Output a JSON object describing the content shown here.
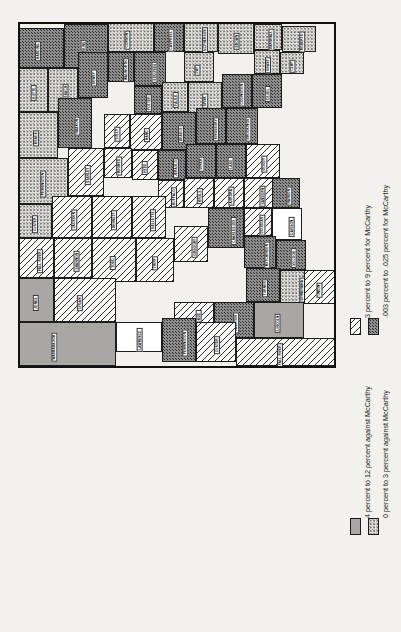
{
  "figure": {
    "kind": "thematic-choropleth-map",
    "orientation": "rotated-90-ccw",
    "region": "South Dakota counties",
    "background_color": "#f2f1ee"
  },
  "legend": {
    "entries": [
      {
        "id": "for-3-to-9",
        "swatch": "diagonal-hatch",
        "label": "3 percent to 9 percent for McCarthy",
        "color": "#fbfbf9"
      },
      {
        "id": "for-003-to-025",
        "swatch": "dark-stipple",
        "label": ".003 percent to .025 percent for McCarthy",
        "color": "#8e8e8e"
      },
      {
        "id": "against-4-to-12",
        "swatch": "solid-gray",
        "label": "4 percent to 12 percent against McCarthy",
        "color": "#a8a7a3"
      },
      {
        "id": "against-0-to-3",
        "swatch": "light-stipple",
        "label": "0 percent to 3 percent against McCarthy",
        "color": "#e3e2de"
      }
    ]
  },
  "map": {
    "counties": [
      {
        "name": "HARDING",
        "fill": "p-dark",
        "x": 0,
        "y": 6,
        "w": 46,
        "h": 40,
        "lx": 10,
        "ly": 26
      },
      {
        "name": "PERKINS",
        "fill": "p-dark",
        "x": 46,
        "y": 2,
        "w": 44,
        "h": 44,
        "lx": 56,
        "ly": 24
      },
      {
        "name": "CORSON",
        "fill": "p-light",
        "x": 90,
        "y": 0,
        "w": 46,
        "h": 30,
        "lx": 100,
        "ly": 15
      },
      {
        "name": "CAMPBELL",
        "fill": "p-dark",
        "x": 136,
        "y": 0,
        "w": 30,
        "h": 30,
        "lx": 142,
        "ly": 15
      },
      {
        "name": "MCPHERSON",
        "fill": "p-light",
        "x": 166,
        "y": 0,
        "w": 34,
        "h": 30,
        "lx": 174,
        "ly": 15
      },
      {
        "name": "BROWN",
        "fill": "p-light",
        "x": 200,
        "y": 0,
        "w": 36,
        "h": 32,
        "lx": 210,
        "ly": 16
      },
      {
        "name": "MARSHALL",
        "fill": "p-light",
        "x": 236,
        "y": 2,
        "w": 28,
        "h": 26,
        "lx": 242,
        "ly": 15
      },
      {
        "name": "ROBERTS",
        "fill": "p-light",
        "x": 264,
        "y": 4,
        "w": 34,
        "h": 26,
        "lx": 274,
        "ly": 17
      },
      {
        "name": "BUTTE",
        "fill": "p-light",
        "x": 0,
        "y": 46,
        "w": 30,
        "h": 44,
        "lx": 8,
        "ly": 68
      },
      {
        "name": "ZIEBACH",
        "fill": "p-light",
        "x": 30,
        "y": 46,
        "w": 30,
        "h": 44,
        "lx": 38,
        "ly": 68
      },
      {
        "name": "DEWEY",
        "fill": "p-dark",
        "x": 60,
        "y": 30,
        "w": 30,
        "h": 46,
        "lx": 68,
        "ly": 53
      },
      {
        "name": "WALWORTH",
        "fill": "p-dark",
        "x": 90,
        "y": 30,
        "w": 26,
        "h": 30,
        "lx": 96,
        "ly": 45
      },
      {
        "name": "EDMUNDS",
        "fill": "p-dark",
        "x": 116,
        "y": 30,
        "w": 32,
        "h": 34,
        "lx": 126,
        "ly": 47
      },
      {
        "name": "DAY",
        "fill": "p-light",
        "x": 166,
        "y": 30,
        "w": 30,
        "h": 30,
        "lx": 174,
        "ly": 45
      },
      {
        "name": "GRANT",
        "fill": "p-light",
        "x": 236,
        "y": 28,
        "w": 26,
        "h": 24,
        "lx": 242,
        "ly": 40
      },
      {
        "name": "CLAY",
        "fill": "p-light",
        "x": 262,
        "y": 30,
        "w": 24,
        "h": 22,
        "lx": 268,
        "ly": 41
      },
      {
        "name": "MEADE",
        "fill": "p-light",
        "x": 0,
        "y": 90,
        "w": 40,
        "h": 46,
        "lx": 10,
        "ly": 113
      },
      {
        "name": "HAAKON",
        "fill": "p-dark",
        "x": 40,
        "y": 76,
        "w": 34,
        "h": 50,
        "lx": 50,
        "ly": 101
      },
      {
        "name": "POTTER",
        "fill": "p-dark",
        "x": 116,
        "y": 64,
        "w": 28,
        "h": 28,
        "lx": 122,
        "ly": 78
      },
      {
        "name": "FAULK",
        "fill": "p-light",
        "x": 144,
        "y": 60,
        "w": 26,
        "h": 30,
        "lx": 150,
        "ly": 75
      },
      {
        "name": "SPINK",
        "fill": "p-light",
        "x": 170,
        "y": 60,
        "w": 34,
        "h": 32,
        "lx": 180,
        "ly": 76
      },
      {
        "name": "CODINGTON",
        "fill": "p-dark",
        "x": 204,
        "y": 52,
        "w": 30,
        "h": 34,
        "lx": 212,
        "ly": 69
      },
      {
        "name": "DEUEL",
        "fill": "p-dark",
        "x": 234,
        "y": 52,
        "w": 30,
        "h": 34,
        "lx": 242,
        "ly": 69
      },
      {
        "name": "PENNINGTON",
        "fill": "p-light",
        "x": 0,
        "y": 136,
        "w": 50,
        "h": 46,
        "lx": 12,
        "ly": 159
      },
      {
        "name": "STANLEY",
        "fill": "p-hatch",
        "x": 50,
        "y": 126,
        "w": 36,
        "h": 48,
        "lx": 60,
        "ly": 150
      },
      {
        "name": "SULLY",
        "fill": "p-hatch",
        "x": 86,
        "y": 92,
        "w": 26,
        "h": 34,
        "lx": 92,
        "ly": 109
      },
      {
        "name": "HAND",
        "fill": "p-hatch",
        "x": 112,
        "y": 92,
        "w": 32,
        "h": 36,
        "lx": 122,
        "ly": 110
      },
      {
        "name": "BEADLE",
        "fill": "p-dark",
        "x": 144,
        "y": 90,
        "w": 34,
        "h": 38,
        "lx": 154,
        "ly": 109
      },
      {
        "name": "KINGSBURY",
        "fill": "p-dark",
        "x": 178,
        "y": 86,
        "w": 30,
        "h": 36,
        "lx": 186,
        "ly": 104
      },
      {
        "name": "BROOKINGS",
        "fill": "p-dark",
        "x": 208,
        "y": 86,
        "w": 32,
        "h": 36,
        "lx": 218,
        "ly": 104
      },
      {
        "name": "CUSTER",
        "fill": "p-light",
        "x": 0,
        "y": 182,
        "w": 34,
        "h": 34,
        "lx": 8,
        "ly": 199
      },
      {
        "name": "JACKSON",
        "fill": "p-hatch",
        "x": 34,
        "y": 174,
        "w": 40,
        "h": 42,
        "lx": 46,
        "ly": 195
      },
      {
        "name": "HUGHES",
        "fill": "p-hatch",
        "x": 86,
        "y": 126,
        "w": 28,
        "h": 30,
        "lx": 92,
        "ly": 141
      },
      {
        "name": "HYDE",
        "fill": "p-hatch",
        "x": 114,
        "y": 128,
        "w": 26,
        "h": 30,
        "lx": 120,
        "ly": 143
      },
      {
        "name": "JERAULD",
        "fill": "p-dark",
        "x": 140,
        "y": 128,
        "w": 28,
        "h": 30,
        "lx": 148,
        "ly": 143
      },
      {
        "name": "MINER",
        "fill": "p-dark",
        "x": 168,
        "y": 122,
        "w": 30,
        "h": 34,
        "lx": 176,
        "ly": 139
      },
      {
        "name": "LAKE",
        "fill": "p-dark",
        "x": 198,
        "y": 122,
        "w": 30,
        "h": 34,
        "lx": 206,
        "ly": 139
      },
      {
        "name": "MOODY",
        "fill": "p-hatch",
        "x": 228,
        "y": 122,
        "w": 34,
        "h": 34,
        "lx": 238,
        "ly": 139
      },
      {
        "name": "FALL RIVER",
        "fill": "p-hatch",
        "x": 0,
        "y": 216,
        "w": 36,
        "h": 40,
        "lx": 10,
        "ly": 236
      },
      {
        "name": "SHANNON",
        "fill": "p-hatch",
        "x": 36,
        "y": 216,
        "w": 38,
        "h": 40,
        "lx": 48,
        "ly": 236
      },
      {
        "name": "BUFFALO",
        "fill": "p-hatch",
        "x": 140,
        "y": 158,
        "w": 26,
        "h": 28,
        "lx": 146,
        "ly": 172
      },
      {
        "name": "BRULE",
        "fill": "p-hatch",
        "x": 166,
        "y": 156,
        "w": 30,
        "h": 30,
        "lx": 174,
        "ly": 171
      },
      {
        "name": "AURORA",
        "fill": "p-hatch",
        "x": 196,
        "y": 156,
        "w": 30,
        "h": 30,
        "lx": 204,
        "ly": 171
      },
      {
        "name": "SANBORN",
        "fill": "p-hatch",
        "x": 226,
        "y": 156,
        "w": 30,
        "h": 30,
        "lx": 234,
        "ly": 171
      },
      {
        "name": "BENNETT",
        "fill": "p-hatch",
        "x": 74,
        "y": 174,
        "w": 40,
        "h": 42,
        "lx": 86,
        "ly": 195
      },
      {
        "name": "MELLETTE",
        "fill": "p-hatch",
        "x": 114,
        "y": 174,
        "w": 34,
        "h": 42,
        "lx": 124,
        "ly": 195
      },
      {
        "name": "TODD",
        "fill": "p-hatch",
        "x": 74,
        "y": 216,
        "w": 44,
        "h": 44,
        "lx": 88,
        "ly": 238
      },
      {
        "name": "TRIPP",
        "fill": "p-hatch",
        "x": 118,
        "y": 216,
        "w": 38,
        "h": 44,
        "lx": 130,
        "ly": 238
      },
      {
        "name": "GREGORY",
        "fill": "p-hatch",
        "x": 156,
        "y": 204,
        "w": 34,
        "h": 36,
        "lx": 166,
        "ly": 222
      },
      {
        "name": "CHARLES MIX",
        "fill": "p-dark",
        "x": 190,
        "y": 186,
        "w": 36,
        "h": 40,
        "lx": 202,
        "ly": 206
      },
      {
        "name": "DOUGLAS",
        "fill": "p-hatch",
        "x": 226,
        "y": 186,
        "w": 28,
        "h": 28,
        "lx": 234,
        "ly": 200
      },
      {
        "name": "HANSON",
        "fill": "p-dark",
        "x": 254,
        "y": 156,
        "w": 28,
        "h": 30,
        "lx": 262,
        "ly": 171
      },
      {
        "name": "DAVISON",
        "fill": "p-white",
        "x": 254,
        "y": 186,
        "w": 30,
        "h": 32,
        "lx": 264,
        "ly": 202
      },
      {
        "name": "HUTCHINSON",
        "fill": "p-dark",
        "x": 226,
        "y": 214,
        "w": 32,
        "h": 32,
        "lx": 236,
        "ly": 230
      },
      {
        "name": "MCCOOK",
        "fill": "p-dark",
        "x": 258,
        "y": 218,
        "w": 30,
        "h": 30,
        "lx": 266,
        "ly": 233
      },
      {
        "name": "MINNEHAHA",
        "fill": "p-light",
        "x": 262,
        "y": 248,
        "w": 34,
        "h": 34,
        "lx": 272,
        "ly": 265
      },
      {
        "name": "TURNER",
        "fill": "p-dark",
        "x": 228,
        "y": 246,
        "w": 34,
        "h": 34,
        "lx": 238,
        "ly": 263
      },
      {
        "name": "LINCOLN",
        "fill": "p-solid",
        "x": 236,
        "y": 280,
        "w": 50,
        "h": 36,
        "lx": 250,
        "ly": 298
      },
      {
        "name": "YANKTON",
        "fill": "p-dark",
        "x": 196,
        "y": 280,
        "w": 40,
        "h": 36,
        "lx": 208,
        "ly": 298
      },
      {
        "name": "BON HOMME",
        "fill": "p-hatch",
        "x": 156,
        "y": 280,
        "w": 40,
        "h": 36,
        "lx": 168,
        "ly": 298
      },
      {
        "name": "UNION",
        "fill": "p-hatch",
        "x": 286,
        "y": 248,
        "w": 32,
        "h": 34,
        "lx": 294,
        "ly": 265
      },
      {
        "name": "LYMAN",
        "fill": "p-hatch",
        "x": 36,
        "y": 256,
        "w": 62,
        "h": 44,
        "lx": 54,
        "ly": 278
      },
      {
        "name": "JONES",
        "fill": "p-solid",
        "x": 0,
        "y": 256,
        "w": 36,
        "h": 44,
        "lx": 10,
        "ly": 278
      },
      {
        "name": "LAWRENCE",
        "fill": "p-white",
        "x": 98,
        "y": 300,
        "w": 46,
        "h": 30,
        "lx": 110,
        "ly": 315
      },
      {
        "name": "WASHABAUGH",
        "fill": "p-solid",
        "x": 0,
        "y": 300,
        "w": 98,
        "h": 44,
        "lx": 22,
        "ly": 322
      },
      {
        "name": "PENNINGTON2",
        "fill": "p-dark",
        "x": 144,
        "y": 296,
        "w": 34,
        "h": 44,
        "lx": 154,
        "ly": 318
      },
      {
        "name": "CUSTER2",
        "fill": "p-hatch",
        "x": 178,
        "y": 300,
        "w": 40,
        "h": 40,
        "lx": 190,
        "ly": 320
      },
      {
        "name": "FALL RIVER2",
        "fill": "p-hatch",
        "x": 218,
        "y": 316,
        "w": 100,
        "h": 28,
        "lx": 250,
        "ly": 330
      }
    ]
  }
}
